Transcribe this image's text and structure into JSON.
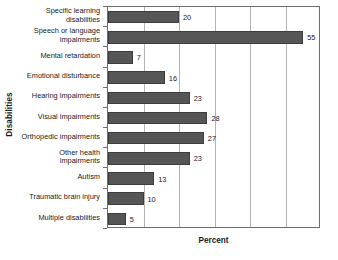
{
  "chart_data": {
    "type": "bar",
    "orientation": "horizontal",
    "title": "",
    "xlabel": "Percent",
    "ylabel": "Disabilities",
    "categories": [
      "Specific learning disabilities",
      "Speech or language impairments",
      "Mental retardation",
      "Emotional disturbance",
      "Hearing impairments",
      "Visual impairments",
      "Orthopedic impairments",
      "Other health impairments",
      "Autism",
      "Traumatic brain injury",
      "Multiple disabilities"
    ],
    "values": [
      20,
      55,
      7,
      16,
      23,
      28,
      27,
      23,
      13,
      10,
      5
    ],
    "value_labels": [
      "20",
      "55",
      "7",
      "16",
      "23",
      "28",
      "27",
      "23",
      "13",
      "10",
      "5"
    ],
    "xlim": [
      0,
      60
    ],
    "ylim": null,
    "gridlines_x": [
      10,
      20,
      30,
      40,
      50,
      60
    ],
    "x_tick_labels": [],
    "grid": true,
    "legend": null,
    "bar_color": "#565656",
    "bar_edge_color": "#3d3d3d",
    "grid_color": "#b4b4b4",
    "axis_color": "#6e6e6e",
    "text_color": "#1a1a1a",
    "background": "#ffffff"
  }
}
